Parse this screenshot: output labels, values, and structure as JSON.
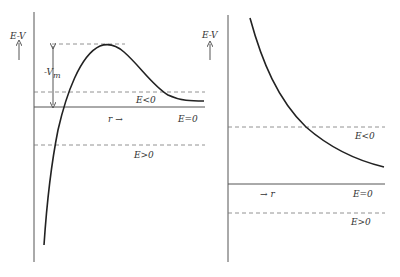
{
  "left_panel": {
    "y_axis_label": "E-V",
    "x_axis_label": "r →",
    "barrier_label": "-V",
    "barrier_label_sub": "m",
    "levels": {
      "e_neg": "E<0",
      "e_zero": "E=0",
      "e_pos": "E>0"
    }
  },
  "right_panel": {
    "y_axis_label": "E-V",
    "x_axis_label": "→ r",
    "levels": {
      "e_neg": "E<0",
      "e_zero": "E=0",
      "e_pos": "E>0"
    }
  }
}
